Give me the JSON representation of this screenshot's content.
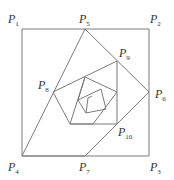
{
  "diagram": {
    "labels": [
      {
        "id": "P1",
        "base": "P",
        "sub": "1",
        "x": 8,
        "y": 23
      },
      {
        "id": "P2",
        "base": "P",
        "sub": "2",
        "x": 150,
        "y": 23
      },
      {
        "id": "P3",
        "base": "P",
        "sub": "3",
        "x": 150,
        "y": 171
      },
      {
        "id": "P4",
        "base": "P",
        "sub": "4",
        "x": 8,
        "y": 171
      },
      {
        "id": "P5",
        "base": "P",
        "sub": "5",
        "x": 79,
        "y": 23
      },
      {
        "id": "P6",
        "base": "P",
        "sub": "6",
        "x": 155,
        "y": 98
      },
      {
        "id": "P7",
        "base": "P",
        "sub": "7",
        "x": 79,
        "y": 171
      },
      {
        "id": "P8",
        "base": "P",
        "sub": "8",
        "x": 38,
        "y": 89
      },
      {
        "id": "P9",
        "base": "P",
        "sub": "9",
        "x": 119,
        "y": 57
      },
      {
        "id": "P10",
        "base": "P",
        "sub": "10",
        "x": 118,
        "y": 136
      }
    ]
  }
}
